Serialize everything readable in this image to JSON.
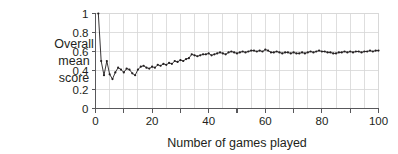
{
  "chart_data": {
    "type": "line",
    "title": "",
    "subtitle": "",
    "xlabel": "Number of games played",
    "ylabel": "Overall mean score",
    "ylabel_lines": [
      "Overall",
      "mean",
      "score"
    ],
    "xlim": [
      0,
      100
    ],
    "ylim": [
      0,
      1
    ],
    "grid": true,
    "grid_x_step": 5,
    "grid_y_step": 0.2,
    "legend": "none",
    "marker": "filled-circle",
    "line_color": "#231f20",
    "xticks": [
      0,
      10,
      20,
      30,
      40,
      50,
      60,
      70,
      80,
      90,
      100
    ],
    "xtick_labels": [
      "0",
      "",
      "20",
      "",
      "40",
      "",
      "60",
      "",
      "80",
      "",
      "100"
    ],
    "yticks": [
      0,
      0.2,
      0.4,
      0.6,
      0.8,
      1
    ],
    "ytick_labels": [
      "0",
      "0.2",
      "0.4",
      "0.6",
      "0.8",
      "1"
    ],
    "series": [
      {
        "name": "Overall mean score",
        "x": [
          1,
          2,
          3,
          4,
          5,
          6,
          7,
          8,
          9,
          10,
          11,
          12,
          13,
          14,
          15,
          16,
          17,
          18,
          19,
          20,
          21,
          22,
          23,
          24,
          25,
          26,
          27,
          28,
          29,
          30,
          31,
          32,
          33,
          34,
          35,
          36,
          37,
          38,
          39,
          40,
          41,
          42,
          43,
          44,
          45,
          46,
          47,
          48,
          49,
          50,
          51,
          52,
          53,
          54,
          55,
          56,
          57,
          58,
          59,
          60,
          61,
          62,
          63,
          64,
          65,
          66,
          67,
          68,
          69,
          70,
          71,
          72,
          73,
          74,
          75,
          76,
          77,
          78,
          79,
          80,
          81,
          82,
          83,
          84,
          85,
          86,
          87,
          88,
          89,
          90,
          91,
          92,
          93,
          94,
          95,
          96,
          97,
          98,
          99,
          100
        ],
        "values": [
          1.0,
          0.5,
          0.35,
          0.5,
          0.36,
          0.31,
          0.38,
          0.43,
          0.41,
          0.38,
          0.42,
          0.41,
          0.37,
          0.35,
          0.41,
          0.44,
          0.45,
          0.43,
          0.42,
          0.44,
          0.43,
          0.46,
          0.45,
          0.47,
          0.46,
          0.48,
          0.47,
          0.5,
          0.49,
          0.51,
          0.5,
          0.52,
          0.53,
          0.57,
          0.56,
          0.55,
          0.56,
          0.57,
          0.57,
          0.58,
          0.56,
          0.57,
          0.58,
          0.59,
          0.58,
          0.57,
          0.59,
          0.6,
          0.59,
          0.58,
          0.59,
          0.6,
          0.59,
          0.6,
          0.61,
          0.61,
          0.6,
          0.61,
          0.6,
          0.62,
          0.61,
          0.59,
          0.59,
          0.6,
          0.59,
          0.58,
          0.59,
          0.59,
          0.58,
          0.59,
          0.58,
          0.58,
          0.59,
          0.58,
          0.59,
          0.6,
          0.59,
          0.6,
          0.61,
          0.6,
          0.6,
          0.59,
          0.59,
          0.58,
          0.58,
          0.59,
          0.59,
          0.6,
          0.59,
          0.6,
          0.59,
          0.6,
          0.6,
          0.59,
          0.6,
          0.6,
          0.61,
          0.6,
          0.61,
          0.61
        ]
      }
    ]
  },
  "colors": {
    "ink": "#231f20",
    "grid": "#d6d6d6",
    "axis": "#58585b",
    "background": "#ffffff"
  }
}
